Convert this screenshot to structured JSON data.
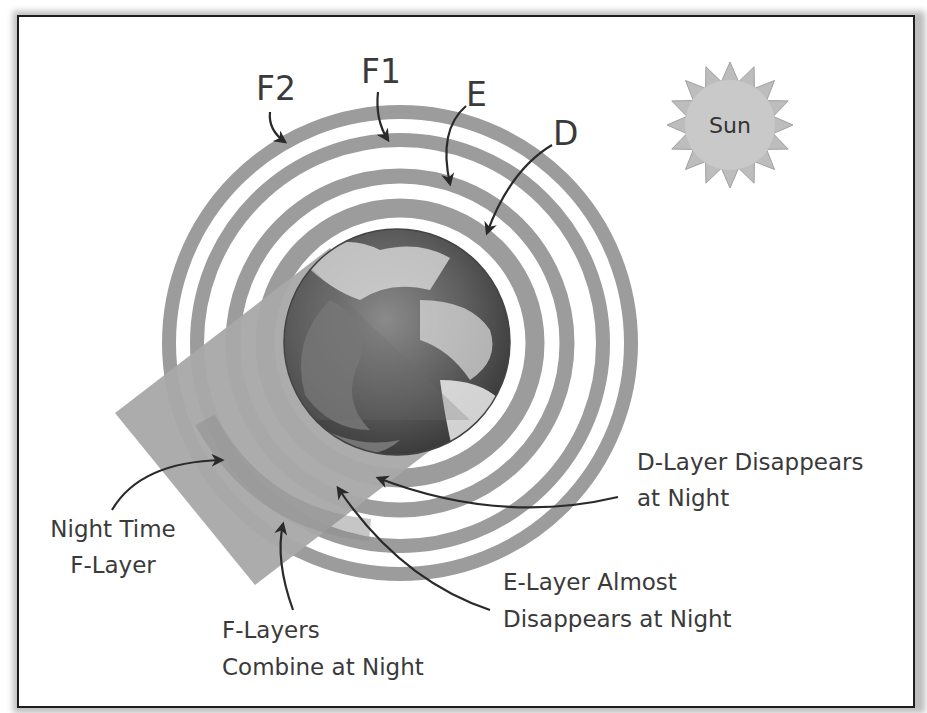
{
  "colors": {
    "ring": "#9c9c9c",
    "night_shadow": "#a9a9a9",
    "sun_fill": "#c9c9c9",
    "text": "#3a3a3a",
    "arrow": "#2a2a2a"
  },
  "layers": [
    {
      "id": "F2",
      "label": "F2"
    },
    {
      "id": "F1",
      "label": "F1"
    },
    {
      "id": "E",
      "label": "E"
    },
    {
      "id": "D",
      "label": "D"
    }
  ],
  "sun": {
    "label": "Sun"
  },
  "earth": {
    "icon": "earth-globe-icon"
  },
  "annotations": {
    "d_layer": {
      "line1": "D-Layer Disappears",
      "line2": "at Night"
    },
    "e_layer": {
      "line1": "E-Layer Almost",
      "line2": "Disappears at Night"
    },
    "f_combine": {
      "line1": "F-Layers",
      "line2": "Combine at Night"
    },
    "night_f": {
      "line1": "Night Time",
      "line2": "F-Layer"
    }
  }
}
